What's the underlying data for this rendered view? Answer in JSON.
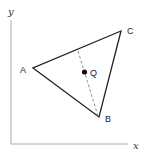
{
  "diagram": {
    "axes": {
      "x_label": "x",
      "y_label": "y"
    },
    "points": {
      "A": {
        "label": "A"
      },
      "B": {
        "label": "B"
      },
      "C": {
        "label": "C"
      },
      "Q": {
        "label": "Q"
      }
    },
    "colors": {
      "line": "#222222",
      "axis": "#999999",
      "dashed": "#888888"
    }
  }
}
